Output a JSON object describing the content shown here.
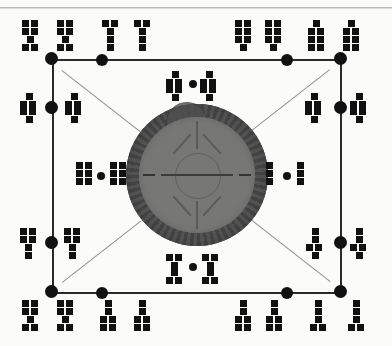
{
  "document": {
    "title": "Scanned schematic diagram",
    "kind": "network-graph-with-central-disc",
    "background_color": "#fbfbfa",
    "ink_color": "#111111"
  },
  "central_object": {
    "name": "central-disc",
    "description": "Dark circular disc with textured outer ring, lighter inner face, concentric inner circle, radial spokes and tick marks",
    "ring_color": "#4b4b4b",
    "face_color": "#777776",
    "center": {
      "x": 197,
      "y": 175
    },
    "outer_radius": 71,
    "face_radius": 58,
    "inner_circle_radius": 22,
    "spoke_count": 8
  },
  "frame": {
    "name": "graph-frame",
    "edge_color": "#2a2a2a",
    "diagonal_color": "#909090",
    "top_y": 59,
    "bottom_y": 292,
    "left_x": 52,
    "right_x": 340,
    "diagonals": 4
  },
  "nodes": [
    {
      "id": "n-tl",
      "label": "top-left-corner-node",
      "x": 52,
      "y": 59,
      "size": "big"
    },
    {
      "id": "n-tm1",
      "label": "top-inner-left-node",
      "x": 102,
      "y": 60,
      "size": "mid"
    },
    {
      "id": "n-tm2",
      "label": "top-inner-right-node",
      "x": 287,
      "y": 60,
      "size": "mid"
    },
    {
      "id": "n-tr",
      "label": "top-right-corner-node",
      "x": 340,
      "y": 59,
      "size": "big"
    },
    {
      "id": "n-lu",
      "label": "left-upper-node",
      "x": 52,
      "y": 107,
      "size": "big"
    },
    {
      "id": "n-ru",
      "label": "right-upper-node",
      "x": 340,
      "y": 107,
      "size": "big"
    },
    {
      "id": "n-ll",
      "label": "left-lower-node",
      "x": 52,
      "y": 242,
      "size": "big"
    },
    {
      "id": "n-rl",
      "label": "right-lower-node",
      "x": 340,
      "y": 242,
      "size": "big"
    },
    {
      "id": "n-bl",
      "label": "bottom-left-corner-node",
      "x": 52,
      "y": 292,
      "size": "big"
    },
    {
      "id": "n-bm1",
      "label": "bottom-inner-left-node",
      "x": 102,
      "y": 293,
      "size": "mid"
    },
    {
      "id": "n-bm2",
      "label": "bottom-inner-right-node",
      "x": 287,
      "y": 293,
      "size": "mid"
    },
    {
      "id": "n-br",
      "label": "bottom-right-corner-node",
      "x": 340,
      "y": 292,
      "size": "big"
    },
    {
      "id": "n-ctop",
      "label": "top-center-marker",
      "x": 193,
      "y": 84,
      "size": "small"
    },
    {
      "id": "n-clef",
      "label": "left-center-marker",
      "x": 101,
      "y": 176,
      "size": "small"
    },
    {
      "id": "n-crig",
      "label": "right-center-marker",
      "x": 287,
      "y": 176,
      "size": "small"
    },
    {
      "id": "n-cbot",
      "label": "bottom-center-marker",
      "x": 193,
      "y": 267,
      "size": "small"
    }
  ],
  "glyph_clusters": [
    {
      "id": "g-tl",
      "label": "top-left-glyph-cluster",
      "shapes": [
        "H",
        "H"
      ]
    },
    {
      "id": "g-tm",
      "label": "top-left-inner-glyph-cluster",
      "shapes": [
        "T",
        "T"
      ]
    },
    {
      "id": "g-tmr",
      "label": "top-right-inner-glyph-cluster",
      "shapes": [
        "grid-stem",
        "grid-stem"
      ]
    },
    {
      "id": "g-tr",
      "label": "top-right-glyph-cluster",
      "shapes": [
        "cap-grid",
        "cap-grid"
      ]
    },
    {
      "id": "g-lu",
      "label": "left-upper-glyph-cluster",
      "shapes": [
        "cross",
        "cross"
      ]
    },
    {
      "id": "g-ru",
      "label": "right-upper-glyph-cluster",
      "shapes": [
        "cross",
        "cross"
      ]
    },
    {
      "id": "g-top",
      "label": "top-center-glyph-cluster",
      "shapes": [
        "cross",
        "cross"
      ]
    },
    {
      "id": "g-lef",
      "label": "left-center-glyph-cluster",
      "shapes": [
        "grid",
        "grid"
      ]
    },
    {
      "id": "g-rig",
      "label": "right-center-glyph-cluster",
      "shapes": [
        "column",
        "column"
      ]
    },
    {
      "id": "g-ll",
      "label": "left-lower-glyph-cluster",
      "shapes": [
        "grid-stem",
        "grid-stem"
      ]
    },
    {
      "id": "g-rl",
      "label": "right-lower-glyph-cluster",
      "shapes": [
        "cross",
        "cross"
      ]
    },
    {
      "id": "g-bot",
      "label": "bottom-center-glyph-cluster",
      "shapes": [
        "I",
        "I"
      ]
    },
    {
      "id": "g-bl",
      "label": "bottom-left-glyph-cluster",
      "shapes": [
        "H",
        "H"
      ]
    },
    {
      "id": "g-bm",
      "label": "bottom-left-inner-glyph-cluster",
      "shapes": [
        "stem-grid",
        "stem-grid"
      ]
    },
    {
      "id": "g-bmr",
      "label": "bottom-right-inner-glyph-cluster",
      "shapes": [
        "stem-grid",
        "stem-grid"
      ]
    },
    {
      "id": "g-br",
      "label": "bottom-right-glyph-cluster",
      "shapes": [
        "column-foot",
        "column-foot"
      ]
    }
  ],
  "watermark": {
    "name": "scan-watermark",
    "text": ""
  }
}
